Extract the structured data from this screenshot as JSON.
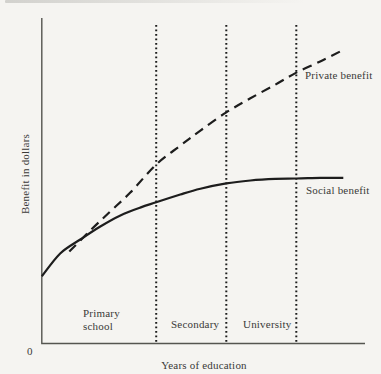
{
  "figure": {
    "paper_color": "#f5f4f1",
    "ink_color": "#1d1d1d",
    "axis_color": "#555550",
    "text_color": "#3a3a38"
  },
  "chart_data": {
    "type": "line",
    "title": "",
    "xlabel": "Years of education",
    "ylabel": "Benefit in dollars",
    "origin_label": "0",
    "xlim": [
      0,
      16
    ],
    "ylim": [
      0,
      10
    ],
    "grid": false,
    "numeric_ticks": false,
    "legend_position": "inline-right-of-curves",
    "series": [
      {
        "name": "Private benefit",
        "style": "dashed",
        "points": [
          [
            1.36,
            2.82
          ],
          [
            2.4,
            3.47
          ],
          [
            3.38,
            4.05
          ],
          [
            4.37,
            4.63
          ],
          [
            5.65,
            5.49
          ],
          [
            6.84,
            6.07
          ],
          [
            7.83,
            6.53
          ],
          [
            9.11,
            7.09
          ],
          [
            10.3,
            7.52
          ],
          [
            11.53,
            7.94
          ],
          [
            12.57,
            8.31
          ],
          [
            13.75,
            8.65
          ],
          [
            14.74,
            8.96
          ]
        ]
      },
      {
        "name": "Social benefit",
        "style": "solid",
        "points": [
          [
            0,
            2.06
          ],
          [
            0.91,
            2.76
          ],
          [
            1.9,
            3.19
          ],
          [
            2.89,
            3.59
          ],
          [
            3.88,
            3.93
          ],
          [
            4.86,
            4.17
          ],
          [
            5.65,
            4.33
          ],
          [
            6.84,
            4.57
          ],
          [
            7.83,
            4.75
          ],
          [
            9.11,
            4.91
          ],
          [
            10.3,
            5.0
          ],
          [
            11.53,
            5.05
          ],
          [
            12.57,
            5.06
          ],
          [
            13.75,
            5.08
          ],
          [
            14.89,
            5.08
          ]
        ]
      }
    ],
    "region_boundaries": [
      5.65,
      9.11,
      12.57
    ],
    "regions": [
      {
        "label": "Primary\nschool"
      },
      {
        "label": "Secondary"
      },
      {
        "label": "University"
      }
    ]
  }
}
